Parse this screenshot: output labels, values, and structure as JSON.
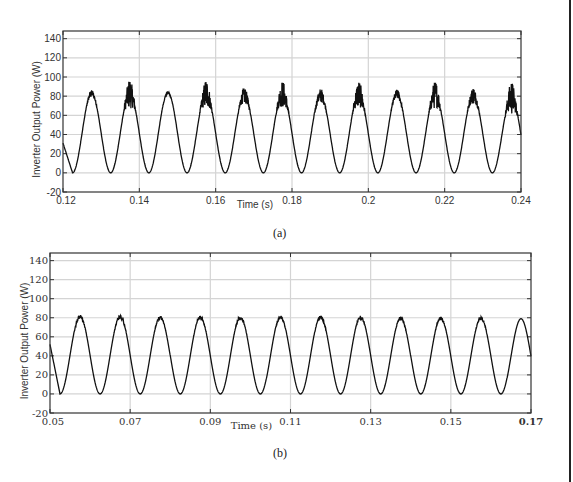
{
  "chart_data": [
    {
      "panel": "(a)",
      "type": "line",
      "title": "",
      "xlabel": "Time (s)",
      "ylabel": "Inverter Output Power (W)",
      "xlim": [
        0.12,
        0.24
      ],
      "ylim": [
        -20,
        148
      ],
      "xticks": [
        "0.12",
        "0.14",
        "0.16",
        "0.18",
        "0.2",
        "0.22",
        "0.24"
      ],
      "xtick_values": [
        0.12,
        0.14,
        0.16,
        0.18,
        0.2,
        0.22,
        0.24
      ],
      "yticks": [
        "-20",
        "0",
        "20",
        "40",
        "60",
        "80",
        "100",
        "120",
        "140"
      ],
      "ytick_values": [
        -20,
        0,
        20,
        40,
        60,
        80,
        100,
        120,
        140
      ],
      "grid": true,
      "frequency_hz": 100,
      "first_min_time": 0.1225,
      "min_value": 0,
      "series": [
        {
          "name": "Inverter Output Power",
          "description": "Rectified-sine power ripple at 100 Hz; alternate peaks show high-frequency oscillation",
          "peaks": [
            {
              "t": 0.1275,
              "max": 86,
              "noise_low": 80
            },
            {
              "t": 0.1375,
              "max": 95,
              "noise_low": 70
            },
            {
              "t": 0.1475,
              "max": 85,
              "noise_low": 82
            },
            {
              "t": 0.1575,
              "max": 95,
              "noise_low": 70
            },
            {
              "t": 0.1675,
              "max": 88,
              "noise_low": 74
            },
            {
              "t": 0.1775,
              "max": 94,
              "noise_low": 71
            },
            {
              "t": 0.1875,
              "max": 87,
              "noise_low": 75
            },
            {
              "t": 0.1975,
              "max": 94,
              "noise_low": 70
            },
            {
              "t": 0.2075,
              "max": 86,
              "noise_low": 78
            },
            {
              "t": 0.2175,
              "max": 94,
              "noise_low": 70
            },
            {
              "t": 0.2275,
              "max": 88,
              "noise_low": 74
            },
            {
              "t": 0.2375,
              "max": 93,
              "noise_low": 65
            }
          ],
          "start_value": 31
        }
      ],
      "caption": "(a)"
    },
    {
      "panel": "(b)",
      "type": "line",
      "title": "",
      "xlabel": "Time (s)",
      "ylabel": "Inverter Output Power (W)",
      "xlim": [
        0.05,
        0.17
      ],
      "ylim": [
        -20,
        148
      ],
      "xticks": [
        "0.05",
        "0.07",
        "0.09",
        "0.11",
        "0.13",
        "0.15",
        "0.17"
      ],
      "xtick_values": [
        0.05,
        0.07,
        0.09,
        0.11,
        0.13,
        0.15,
        0.17
      ],
      "yticks": [
        "-20",
        "0",
        "20",
        "40",
        "60",
        "80",
        "100",
        "120",
        "140"
      ],
      "ytick_values": [
        -20,
        0,
        20,
        40,
        60,
        80,
        100,
        120,
        140
      ],
      "grid": true,
      "frequency_hz": 100,
      "first_min_time": 0.0525,
      "min_value": 0,
      "series": [
        {
          "name": "Inverter Output Power",
          "description": "Smooth rectified-sine power ripple at 100 Hz, peaks ~82 W",
          "peaks": [
            {
              "t": 0.0575,
              "max": 83,
              "noise_low": 79
            },
            {
              "t": 0.0675,
              "max": 83,
              "noise_low": 79
            },
            {
              "t": 0.0775,
              "max": 82,
              "noise_low": 79
            },
            {
              "t": 0.0875,
              "max": 82,
              "noise_low": 79
            },
            {
              "t": 0.0975,
              "max": 82,
              "noise_low": 79
            },
            {
              "t": 0.1075,
              "max": 82,
              "noise_low": 79
            },
            {
              "t": 0.1175,
              "max": 82,
              "noise_low": 79
            },
            {
              "t": 0.1275,
              "max": 82,
              "noise_low": 79
            },
            {
              "t": 0.1375,
              "max": 81,
              "noise_low": 78
            },
            {
              "t": 0.1475,
              "max": 81,
              "noise_low": 78
            },
            {
              "t": 0.1575,
              "max": 81,
              "noise_low": 78
            },
            {
              "t": 0.1675,
              "max": 80,
              "noise_low": 78
            }
          ],
          "start_value": 52,
          "end_value": 52
        }
      ],
      "caption": "(b)"
    }
  ]
}
